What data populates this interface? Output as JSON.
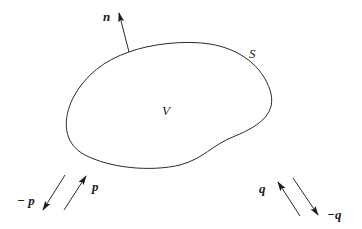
{
  "diagram": {
    "colors": {
      "stroke": "#2a2a2a",
      "background": "#ffffff"
    },
    "labels": {
      "normal": "n",
      "surface": "S",
      "volume": "V",
      "p": "p",
      "neg_p": "− p",
      "q": "q",
      "neg_q": "−q"
    },
    "arrows": [
      {
        "name": "normal-n",
        "from": [
          129,
          52
        ],
        "to": [
          119,
          12
        ]
      },
      {
        "name": "neg-p",
        "from": [
          65,
          175
        ],
        "to": [
          43,
          210
        ]
      },
      {
        "name": "p",
        "from": [
          64,
          210
        ],
        "to": [
          86,
          176
        ]
      },
      {
        "name": "q",
        "from": [
          300,
          216
        ],
        "to": [
          278,
          182
        ]
      },
      {
        "name": "neg-q",
        "from": [
          293,
          178
        ],
        "to": [
          318,
          215
        ]
      }
    ]
  }
}
